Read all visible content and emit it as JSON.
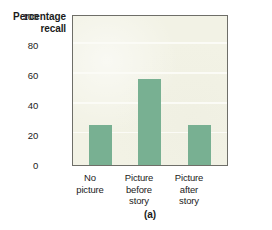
{
  "chart_data": {
    "type": "bar",
    "title": "",
    "xlabel": "",
    "ylabel": "Percentage recall",
    "ylabel_lines": [
      "Percentage",
      "recall"
    ],
    "categories": [
      "No picture",
      "Picture before story",
      "Picture after story"
    ],
    "category_lines": [
      [
        "No",
        "picture"
      ],
      [
        "Picture",
        "before",
        "story"
      ],
      [
        "Picture",
        "after",
        "story"
      ]
    ],
    "values": [
      27,
      58,
      27
    ],
    "ylim": [
      0,
      100
    ],
    "yticks": [
      100,
      80,
      60,
      40,
      20,
      0
    ],
    "ytick_labels": [
      "100",
      "80",
      "60",
      "40",
      "20",
      "0"
    ],
    "gridlines": [
      20,
      40,
      60,
      80
    ],
    "grid": true,
    "legend": null,
    "caption": "(a)",
    "colors": {
      "bar": "#78b092",
      "plot_background": "#f2f2e5",
      "gridline": "#fbfbf6",
      "frame": "#6e6e68",
      "text": "#1b1b1b",
      "page_background": "#ffffff"
    }
  }
}
